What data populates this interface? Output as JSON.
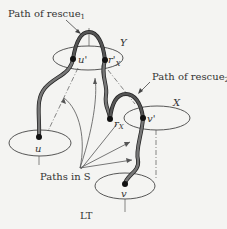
{
  "labels": {
    "rescue1": "Path of rescue",
    "rescue1_sub": "1",
    "rescue2": "Path of rescue",
    "rescue2_sub": "2",
    "Y": "Y",
    "X": "X",
    "u_prime": "u'",
    "r_x_prime": "r'",
    "r_x_prime_sub": "X",
    "r_x": "r",
    "r_x_sub": "X",
    "v_prime": "v'",
    "u": "u",
    "v": "v",
    "paths_in_s": "Paths in S",
    "lt": "LT"
  },
  "colors": {
    "background": "#f4f4f2",
    "ink": "#333333",
    "thick_path": "#555555",
    "thick_path_outline": "#222222"
  }
}
